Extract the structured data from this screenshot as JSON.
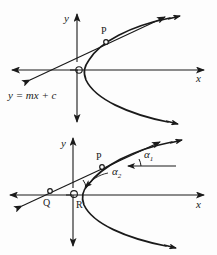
{
  "figure": {
    "background_color": "#fdfdfd",
    "ink_color": "#1a1a1a",
    "panels": [
      {
        "id": "top-panel",
        "axis_labels": {
          "x": "x",
          "y": "y"
        },
        "point_labels": [
          {
            "name": "P",
            "text": "P"
          }
        ],
        "equation_label": "y = mx + c",
        "curve": "rightward-opening parabola, vertex at origin",
        "line": "straight line through the parabola, arrows at both ends"
      },
      {
        "id": "bottom-panel",
        "axis_labels": {
          "x": "x",
          "y": "y"
        },
        "point_labels": [
          {
            "name": "P",
            "text": "P"
          },
          {
            "name": "Q",
            "text": "Q"
          },
          {
            "name": "R",
            "text": "R"
          }
        ],
        "angle_labels": [
          {
            "name": "alpha-1",
            "base": "α",
            "sub": "1"
          },
          {
            "name": "alpha-2",
            "base": "α",
            "sub": "2"
          }
        ],
        "curve": "rightward-opening parabola, vertex at origin",
        "line": "secant line through Q and P, arrows at both ends",
        "reference_ray": "horizontal ray at P used for angle alpha-1"
      }
    ]
  }
}
